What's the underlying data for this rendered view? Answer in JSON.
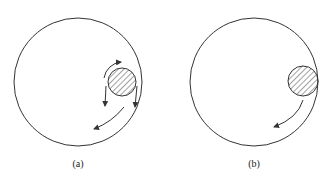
{
  "panels": [
    {
      "id": "a",
      "label": "(a)",
      "description": "Small hatched circle inside large circle near right wall; arrows indicate rotation around small circle and flow along outer wall"
    },
    {
      "id": "b",
      "label": "(b)",
      "description": "Small hatched circle touching inner right wall of large circle; single curved arrow downward-left"
    }
  ],
  "colors": {
    "stroke": "#333333",
    "background": "#ffffff"
  }
}
